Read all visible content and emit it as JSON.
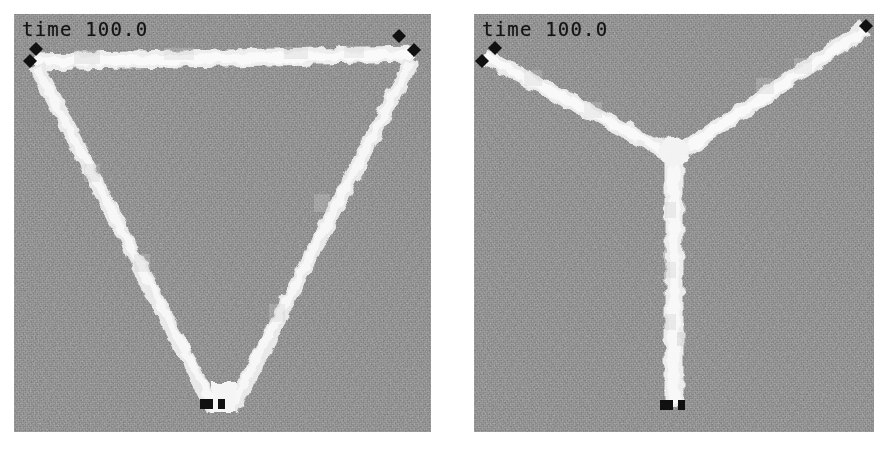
{
  "figure": {
    "background_color": "#ffffff",
    "panel_background_color": "#8b8b8b",
    "filament_color": "#f2f2f2",
    "marker_color": "#101010",
    "label_color": "#141414"
  },
  "panels": [
    {
      "id": "left",
      "name": "triangle-configuration",
      "time_label": "time 100.0",
      "shape": "inverted-triangle",
      "bounds": {
        "x": 14,
        "y": 14,
        "width": 417,
        "height": 418
      },
      "nodes": [
        {
          "name": "top-left-vertex",
          "x": 28,
          "y": 50
        },
        {
          "name": "top-right-vertex",
          "x": 392,
          "y": 44
        },
        {
          "name": "bottom-vertex",
          "x": 208,
          "y": 392
        }
      ],
      "edges": [
        {
          "name": "top-bar",
          "from": "top-left-vertex",
          "to": "top-right-vertex"
        },
        {
          "name": "left-arm",
          "from": "top-left-vertex",
          "to": "bottom-vertex"
        },
        {
          "name": "right-arm",
          "from": "top-right-vertex",
          "to": "bottom-vertex"
        }
      ],
      "markers": [
        {
          "name": "anchor-marker",
          "shape": "diamond",
          "x": 23,
          "y": 61
        },
        {
          "name": "anchor-marker",
          "shape": "diamond",
          "x": 36,
          "y": 49
        },
        {
          "name": "anchor-marker",
          "shape": "diamond",
          "x": 399,
          "y": 43
        },
        {
          "name": "anchor-marker",
          "shape": "diamond",
          "x": 414,
          "y": 57
        },
        {
          "name": "anchor-marker",
          "shape": "square",
          "x": 202,
          "y": 402
        },
        {
          "name": "anchor-marker",
          "shape": "square",
          "x": 217,
          "y": 402
        }
      ]
    },
    {
      "id": "right",
      "name": "steiner-y-configuration",
      "time_label": "time 100.0",
      "shape": "y-junction",
      "bounds": {
        "x": 474,
        "y": 14,
        "width": 400,
        "height": 418
      },
      "nodes": [
        {
          "name": "top-left-vertex",
          "x": 486,
          "y": 50
        },
        {
          "name": "top-right-vertex",
          "x": 862,
          "y": 30
        },
        {
          "name": "junction-point",
          "x": 672,
          "y": 152
        },
        {
          "name": "bottom-vertex",
          "x": 672,
          "y": 398
        }
      ],
      "edges": [
        {
          "name": "left-arm",
          "from": "top-left-vertex",
          "to": "junction-point"
        },
        {
          "name": "right-arm",
          "from": "top-right-vertex",
          "to": "junction-point"
        },
        {
          "name": "stem",
          "from": "junction-point",
          "to": "bottom-vertex"
        }
      ],
      "markers": [
        {
          "name": "anchor-marker",
          "shape": "diamond",
          "x": 482,
          "y": 60
        },
        {
          "name": "anchor-marker",
          "shape": "diamond",
          "x": 495,
          "y": 48
        },
        {
          "name": "anchor-marker",
          "shape": "diamond",
          "x": 866,
          "y": 33
        },
        {
          "name": "anchor-marker",
          "shape": "square",
          "x": 666,
          "y": 404
        },
        {
          "name": "anchor-marker",
          "shape": "square",
          "x": 681,
          "y": 404
        }
      ]
    }
  ]
}
